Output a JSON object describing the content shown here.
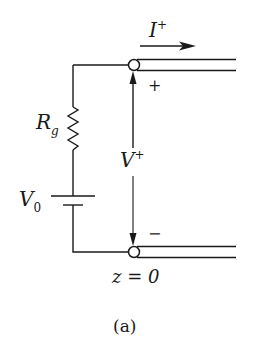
{
  "diagram": {
    "type": "transmission-line-source-circuit",
    "caption": "(a)",
    "labels": {
      "current": {
        "symbol": "I",
        "superscript": "+"
      },
      "resistor": {
        "symbol": "R",
        "subscript": "g"
      },
      "voltage_source": {
        "symbol": "V",
        "subscript": "0"
      },
      "line_voltage": {
        "symbol": "V",
        "superscript": "+"
      },
      "plus_terminal": "+",
      "minus_terminal": "−",
      "position": "z = 0"
    },
    "colors": {
      "ink": "#1a1a1a",
      "background": "#ffffff"
    }
  }
}
